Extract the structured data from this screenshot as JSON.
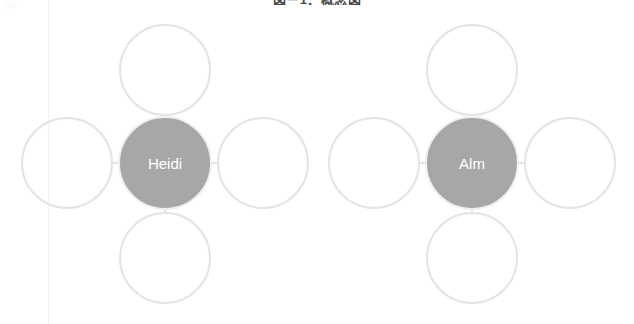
{
  "canvas": {
    "width": 634,
    "height": 324,
    "background_color": "#ffffff"
  },
  "header": {
    "cropped_text": "図－1．概念図"
  },
  "style": {
    "node_outline_color": "#e4e4e4",
    "center_node_fill_color": "#a7a7a7",
    "center_node_label_color": "#ffffff",
    "connector_color": "#e4e4e4",
    "guide_line_color": "#f2f2f2"
  },
  "guide_line": {
    "x": 48
  },
  "diagram": {
    "type": "hub-and-spoke mind map",
    "cluster_count": 2,
    "satellites_per_cluster": 4,
    "clusters": [
      {
        "id": "cluster-heidi",
        "center": {
          "label": "Heidi",
          "cx": 165,
          "cy": 163,
          "r": 47,
          "filled": true
        },
        "satellites": [
          {
            "position": "top",
            "label": "",
            "cx": 165,
            "cy": 70,
            "r": 46,
            "filled": false
          },
          {
            "position": "left",
            "label": "",
            "cx": 67,
            "cy": 163,
            "r": 46,
            "filled": false
          },
          {
            "position": "right",
            "label": "",
            "cx": 263,
            "cy": 163,
            "r": 46,
            "filled": false
          },
          {
            "position": "bottom",
            "label": "",
            "cx": 165,
            "cy": 258,
            "r": 46,
            "filled": false
          }
        ]
      },
      {
        "id": "cluster-alm",
        "center": {
          "label": "Alm",
          "cx": 472,
          "cy": 163,
          "r": 47,
          "filled": true
        },
        "satellites": [
          {
            "position": "top",
            "label": "",
            "cx": 472,
            "cy": 70,
            "r": 46,
            "filled": false
          },
          {
            "position": "left",
            "label": "",
            "cx": 374,
            "cy": 163,
            "r": 46,
            "filled": false
          },
          {
            "position": "right",
            "label": "",
            "cx": 570,
            "cy": 163,
            "r": 46,
            "filled": false
          },
          {
            "position": "bottom",
            "label": "",
            "cx": 472,
            "cy": 258,
            "r": 46,
            "filled": false
          }
        ]
      }
    ]
  }
}
